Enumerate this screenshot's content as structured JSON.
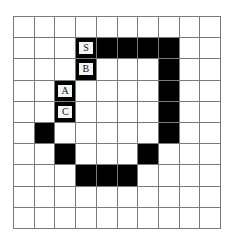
{
  "grid": {
    "rows": 10,
    "cols": 10,
    "colors": {
      "filled": "#000000",
      "empty": "#ffffff",
      "line": "#7a7a7a",
      "label_bg": "#f4f4f4"
    },
    "filled_cells": [
      [
        1,
        3
      ],
      [
        1,
        4
      ],
      [
        1,
        5
      ],
      [
        1,
        6
      ],
      [
        1,
        7
      ],
      [
        2,
        3
      ],
      [
        2,
        7
      ],
      [
        3,
        2
      ],
      [
        3,
        7
      ],
      [
        4,
        2
      ],
      [
        4,
        7
      ],
      [
        5,
        1
      ],
      [
        5,
        7
      ],
      [
        6,
        2
      ],
      [
        6,
        6
      ],
      [
        7,
        3
      ],
      [
        7,
        4
      ],
      [
        7,
        5
      ]
    ],
    "labels": [
      {
        "row": 1,
        "col": 3,
        "text": "S"
      },
      {
        "row": 2,
        "col": 3,
        "text": "B"
      },
      {
        "row": 3,
        "col": 2,
        "text": "A"
      },
      {
        "row": 4,
        "col": 2,
        "text": "C"
      }
    ]
  }
}
